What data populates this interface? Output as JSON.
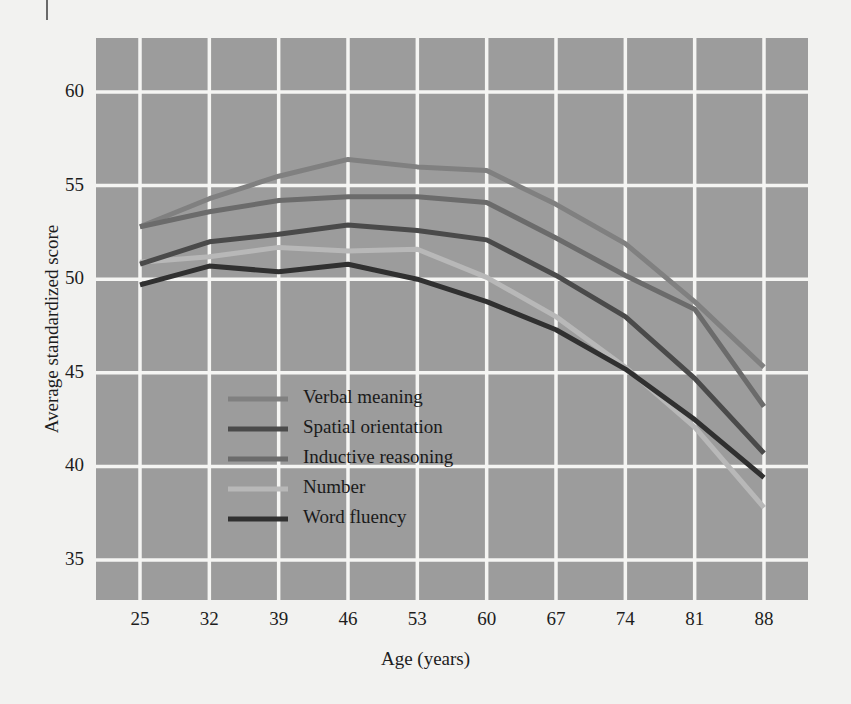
{
  "figure": {
    "background_color": "#f2f2f0",
    "plot_background_color": "#9c9c9c",
    "gridline_color": "#f5f5f3"
  },
  "axes": {
    "x_title": "Age (years)",
    "y_title": "Average standardized score",
    "x_ticks": [
      "25",
      "32",
      "39",
      "46",
      "53",
      "60",
      "67",
      "74",
      "81",
      "88"
    ],
    "y_ticks": [
      "60",
      "55",
      "50",
      "45",
      "40",
      "35"
    ]
  },
  "legend": {
    "entries": [
      {
        "label": "Verbal meaning",
        "color": "#808080"
      },
      {
        "label": "Spatial orientation",
        "color": "#4a4a4a"
      },
      {
        "label": "Inductive reasoning",
        "color": "#6b6b6b"
      },
      {
        "label": "Number",
        "color": "#b8b8b8"
      },
      {
        "label": "Word fluency",
        "color": "#303030"
      }
    ]
  },
  "chart_data": {
    "type": "line",
    "title": "",
    "xlabel": "Age (years)",
    "ylabel": "Average standardized score",
    "x": [
      25,
      32,
      39,
      46,
      53,
      60,
      67,
      74,
      81,
      88
    ],
    "xlim": [
      25,
      88
    ],
    "ylim": [
      33.5,
      61.8
    ],
    "grid": true,
    "legend_position": "inside-lower-left",
    "series": [
      {
        "name": "Verbal meaning",
        "color": "#808080",
        "values": [
          52.8,
          54.3,
          55.5,
          56.4,
          56.0,
          55.8,
          54.0,
          51.9,
          48.8,
          45.3
        ]
      },
      {
        "name": "Spatial orientation",
        "color": "#4a4a4a",
        "values": [
          50.8,
          52.0,
          52.4,
          52.9,
          52.6,
          52.1,
          50.2,
          48.0,
          44.7,
          40.7
        ]
      },
      {
        "name": "Inductive reasoning",
        "color": "#6b6b6b",
        "values": [
          52.8,
          53.6,
          54.2,
          54.4,
          54.4,
          54.1,
          52.2,
          50.2,
          48.4,
          43.2
        ]
      },
      {
        "name": "Number",
        "color": "#b8b8b8",
        "values": [
          50.9,
          51.2,
          51.7,
          51.5,
          51.6,
          50.1,
          48.0,
          45.3,
          42.1,
          37.8
        ]
      },
      {
        "name": "Word fluency",
        "color": "#303030",
        "values": [
          49.7,
          50.7,
          50.4,
          50.8,
          50.0,
          48.8,
          47.3,
          45.2,
          42.5,
          39.4
        ]
      }
    ]
  }
}
